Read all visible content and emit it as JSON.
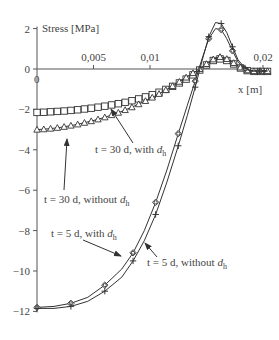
{
  "chart_data": {
    "type": "line",
    "title": "",
    "xlabel": "x [m]",
    "ylabel": "Stress [MPa]",
    "xlim": [
      0,
      0.0205
    ],
    "ylim": [
      -12,
      2
    ],
    "x_ticks": [
      "0",
      "0,005",
      "0,01",
      "0,02"
    ],
    "x_tick_values": [
      0,
      0.005,
      0.01,
      0.02
    ],
    "y_ticks": [
      "2",
      "0",
      "−2",
      "−4",
      "−6",
      "−8",
      "−10",
      "−12"
    ],
    "y_tick_values": [
      2,
      0,
      -2,
      -4,
      -6,
      -8,
      -10,
      -12
    ],
    "grid": false,
    "legend": "annotations",
    "series": [
      {
        "name": "t = 30 d, with d_h",
        "marker": "square",
        "x": [
          0,
          0.0006,
          0.0012,
          0.0018,
          0.0024,
          0.003,
          0.0036,
          0.0042,
          0.0048,
          0.0054,
          0.006,
          0.0066,
          0.0072,
          0.0078,
          0.0084,
          0.009,
          0.0096,
          0.0102,
          0.0108,
          0.0114,
          0.012,
          0.0126,
          0.0132,
          0.0138,
          0.0144,
          0.015,
          0.0156,
          0.0162,
          0.0168,
          0.0174,
          0.018,
          0.0186,
          0.0192,
          0.0198,
          0.0204
        ],
        "y": [
          -2.15,
          -2.14,
          -2.12,
          -2.1,
          -2.08,
          -2.05,
          -2.02,
          -1.98,
          -1.94,
          -1.89,
          -1.84,
          -1.78,
          -1.72,
          -1.65,
          -1.57,
          -1.48,
          -1.38,
          -1.27,
          -1.15,
          -1.01,
          -0.86,
          -0.69,
          -0.5,
          -0.29,
          -0.05,
          0.2,
          0.42,
          0.5,
          0.42,
          0.25,
          0.05,
          -0.08,
          -0.12,
          -0.12,
          -0.12
        ]
      },
      {
        "name": "t = 30 d, without d_h",
        "marker": "triangle",
        "x": [
          0,
          0.0006,
          0.0012,
          0.0018,
          0.0024,
          0.003,
          0.0036,
          0.0042,
          0.0048,
          0.0054,
          0.006,
          0.0066,
          0.0072,
          0.0078,
          0.0084,
          0.009,
          0.0096,
          0.0102,
          0.0108,
          0.0114,
          0.012,
          0.0126,
          0.0132,
          0.0138,
          0.0144,
          0.015,
          0.0156,
          0.0162,
          0.0168,
          0.0174,
          0.018,
          0.0186,
          0.0192,
          0.0198,
          0.0204
        ],
        "y": [
          -3.0,
          -2.98,
          -2.95,
          -2.91,
          -2.86,
          -2.8,
          -2.74,
          -2.66,
          -2.58,
          -2.49,
          -2.39,
          -2.28,
          -2.16,
          -2.03,
          -1.89,
          -1.74,
          -1.58,
          -1.41,
          -1.23,
          -1.04,
          -0.84,
          -0.63,
          -0.42,
          -0.2,
          0.0,
          0.25,
          0.48,
          0.6,
          0.5,
          0.3,
          0.08,
          -0.06,
          -0.1,
          -0.1,
          -0.1
        ]
      },
      {
        "name": "t = 5 d, with d_h",
        "marker": "diamond",
        "x": [
          0,
          0.0015,
          0.003,
          0.0045,
          0.006,
          0.0075,
          0.0085,
          0.0095,
          0.0105,
          0.0115,
          0.0125,
          0.0133,
          0.014,
          0.0146,
          0.0152,
          0.0158,
          0.0163,
          0.0168,
          0.0173,
          0.0178,
          0.0184,
          0.019,
          0.0197,
          0.0204
        ],
        "y": [
          -11.8,
          -11.75,
          -11.6,
          -11.3,
          -10.7,
          -9.9,
          -9.1,
          -8.0,
          -6.6,
          -5.0,
          -3.2,
          -1.8,
          -0.6,
          0.5,
          1.5,
          2.0,
          1.95,
          1.5,
          0.9,
          0.35,
          0.0,
          -0.1,
          -0.1,
          -0.1
        ]
      },
      {
        "name": "t = 5 d, without d_h",
        "marker": "cross",
        "x": [
          0,
          0.0015,
          0.003,
          0.0045,
          0.006,
          0.0075,
          0.0085,
          0.0095,
          0.0105,
          0.0115,
          0.0125,
          0.0133,
          0.014,
          0.0146,
          0.0152,
          0.0158,
          0.0163,
          0.0168,
          0.0173,
          0.0178,
          0.0184,
          0.019,
          0.0197,
          0.0204
        ],
        "y": [
          -11.85,
          -11.85,
          -11.75,
          -11.5,
          -11.0,
          -10.3,
          -9.5,
          -8.5,
          -7.2,
          -5.6,
          -3.8,
          -2.3,
          -0.9,
          0.4,
          1.6,
          2.3,
          2.25,
          1.8,
          1.1,
          0.45,
          0.05,
          -0.1,
          -0.1,
          -0.1
        ]
      }
    ],
    "annotations": [
      {
        "label": "t = 30 d, with d_h",
        "text_main": "t = 30 d, with ",
        "text_var": "d",
        "text_sub": "h",
        "target_series": "t = 30 d, with d_h"
      },
      {
        "label": "t = 30 d, without d_h",
        "text_main": "t = 30 d, without ",
        "text_var": "d",
        "text_sub": "h",
        "target_series": "t = 30 d, without d_h"
      },
      {
        "label": "t = 5 d, with d_h",
        "text_main": "t = 5 d, with ",
        "text_var": "d",
        "text_sub": "h",
        "target_series": "t = 5 d, with d_h"
      },
      {
        "label": "t = 5 d, without d_h",
        "text_main": "t = 5 d, without ",
        "text_var": "d",
        "text_sub": "h",
        "target_series": "t = 5 d, without d_h"
      }
    ]
  }
}
